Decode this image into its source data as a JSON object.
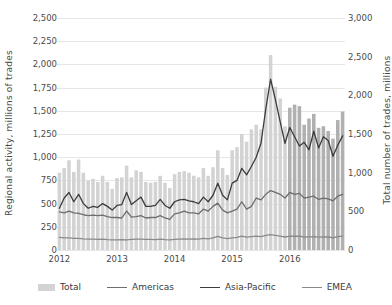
{
  "chart_data": {
    "type": "bar",
    "title": "",
    "subtitle": "",
    "xlabel": "",
    "ylabel": "Regional activity, millions of trades",
    "y2label": "Total number of trades, millions",
    "grid": true,
    "legend_position": "bottom",
    "ylim": [
      0,
      2500
    ],
    "y2lim": [
      0,
      3000
    ],
    "yticks": [
      "0",
      "250",
      "500",
      "750",
      "1,000",
      "1,250",
      "1,500",
      "1,750",
      "2,000",
      "2,250",
      "2,500"
    ],
    "ytick_values": [
      0,
      250,
      500,
      750,
      1000,
      1250,
      1500,
      1750,
      2000,
      2250,
      2500
    ],
    "y2ticks": [
      "0",
      "500",
      "1,000",
      "1,500",
      "2,000",
      "2,500",
      "3,000"
    ],
    "y2tick_values": [
      0,
      500,
      1000,
      1500,
      2000,
      2500,
      3000
    ],
    "xticks": [
      "2012",
      "2013",
      "2014",
      "2015",
      "2016"
    ],
    "xtick_positions": [
      0,
      12,
      24,
      36,
      48
    ],
    "categories": [
      "2012-01",
      "2012-02",
      "2012-03",
      "2012-04",
      "2012-05",
      "2012-06",
      "2012-07",
      "2012-08",
      "2012-09",
      "2012-10",
      "2012-11",
      "2012-12",
      "2013-01",
      "2013-02",
      "2013-03",
      "2013-04",
      "2013-05",
      "2013-06",
      "2013-07",
      "2013-08",
      "2013-09",
      "2013-10",
      "2013-11",
      "2013-12",
      "2014-01",
      "2014-02",
      "2014-03",
      "2014-04",
      "2014-05",
      "2014-06",
      "2014-07",
      "2014-08",
      "2014-09",
      "2014-10",
      "2014-11",
      "2014-12",
      "2015-01",
      "2015-02",
      "2015-03",
      "2015-04",
      "2015-05",
      "2015-06",
      "2015-07",
      "2015-08",
      "2015-09",
      "2015-10",
      "2015-11",
      "2015-12",
      "2016-01",
      "2016-02",
      "2016-03",
      "2016-04",
      "2016-05",
      "2016-06",
      "2016-07",
      "2016-08",
      "2016-09",
      "2016-10",
      "2016-11",
      "2016-12"
    ],
    "series": [
      {
        "name": "Total",
        "kind": "bar",
        "axis": "right",
        "color": "#d3d3d3",
        "color_late": "#b0b0b0",
        "late_start_index": 48,
        "values": [
          1000,
          1060,
          1160,
          1010,
          1170,
          1000,
          900,
          920,
          880,
          960,
          880,
          790,
          930,
          940,
          1090,
          940,
          1030,
          1010,
          880,
          870,
          880,
          960,
          870,
          800,
          980,
          1010,
          1020,
          1000,
          960,
          940,
          1060,
          960,
          1070,
          1290,
          1060,
          970,
          1290,
          1330,
          1500,
          1400,
          1560,
          1620,
          1560,
          2100,
          2520,
          2110,
          1960,
          1600,
          1840,
          1880,
          1860,
          1620,
          1700,
          1760,
          1580,
          1600,
          1540,
          1440,
          1680,
          1790
        ]
      },
      {
        "name": "Americas",
        "kind": "line",
        "axis": "left",
        "color": "#6e6e6e",
        "values": [
          410,
          400,
          420,
          400,
          395,
          380,
          370,
          375,
          370,
          375,
          360,
          350,
          350,
          345,
          420,
          355,
          360,
          370,
          345,
          350,
          350,
          370,
          345,
          330,
          390,
          400,
          420,
          400,
          400,
          390,
          440,
          420,
          470,
          505,
          430,
          400,
          420,
          440,
          520,
          440,
          470,
          560,
          540,
          600,
          640,
          620,
          600,
          560,
          620,
          600,
          610,
          560,
          570,
          580,
          545,
          560,
          550,
          530,
          580,
          600
        ]
      },
      {
        "name": "Asia-Pacific",
        "kind": "line",
        "axis": "left",
        "color": "#3c3c3c",
        "values": [
          450,
          560,
          620,
          520,
          600,
          500,
          450,
          470,
          460,
          500,
          470,
          430,
          480,
          490,
          620,
          490,
          530,
          570,
          470,
          470,
          480,
          545,
          480,
          450,
          520,
          540,
          545,
          530,
          520,
          500,
          570,
          520,
          590,
          720,
          590,
          540,
          720,
          750,
          880,
          810,
          900,
          1000,
          1150,
          1520,
          1840,
          1620,
          1380,
          1150,
          1320,
          1220,
          1120,
          1160,
          1080,
          1280,
          1100,
          1220,
          1180,
          1010,
          1130,
          1230
        ]
      },
      {
        "name": "EMEA",
        "kind": "line",
        "axis": "left",
        "color": "#8a8a8a",
        "values": [
          135,
          130,
          130,
          125,
          125,
          120,
          118,
          118,
          115,
          118,
          112,
          110,
          110,
          112,
          108,
          115,
          118,
          118,
          115,
          115,
          112,
          118,
          112,
          110,
          115,
          118,
          120,
          118,
          120,
          118,
          125,
          120,
          130,
          148,
          130,
          122,
          130,
          135,
          150,
          138,
          145,
          150,
          145,
          158,
          165,
          158,
          150,
          140,
          150,
          148,
          150,
          140,
          142,
          145,
          138,
          140,
          140,
          132,
          145,
          150
        ]
      }
    ]
  },
  "legend": {
    "items": [
      {
        "label": "Total",
        "type": "bar",
        "color": "#d3d3d3"
      },
      {
        "label": "Americas",
        "type": "line",
        "color": "#6e6e6e"
      },
      {
        "label": "Asia-Pacific",
        "type": "line",
        "color": "#3c3c3c"
      },
      {
        "label": "EMEA",
        "type": "line",
        "color": "#8a8a8a"
      }
    ]
  }
}
